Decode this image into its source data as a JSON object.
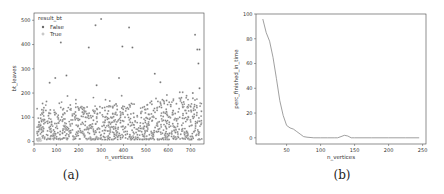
{
  "captions": {
    "a": "(a)",
    "b": "(b)"
  },
  "chart_data": [
    {
      "id": "a",
      "type": "scatter",
      "title": "",
      "xlabel": "n_vertices",
      "ylabel": "bt_leaves",
      "xlim": [
        0,
        760
      ],
      "ylim": [
        -10,
        530
      ],
      "xticks": [
        0,
        100,
        200,
        300,
        400,
        500,
        600,
        700
      ],
      "yticks": [
        0,
        100,
        200,
        300,
        400,
        500
      ],
      "grid": false,
      "legend": {
        "title": "result_bt",
        "position": "upper left",
        "entries": [
          {
            "label": "False",
            "marker": "filled-dot"
          },
          {
            "label": "True",
            "marker": "hollow-dot"
          }
        ]
      },
      "series": [
        {
          "name": "True",
          "points": [
            [
              15,
              5
            ],
            [
              18,
              8
            ],
            [
              20,
              3
            ],
            [
              22,
              10
            ],
            [
              25,
              6
            ],
            [
              28,
              12
            ],
            [
              30,
              4
            ]
          ]
        },
        {
          "name": "False",
          "outliers": [
            [
              120,
              408
            ],
            [
              245,
              388
            ],
            [
              275,
              480
            ],
            [
              300,
              505
            ],
            [
              395,
              392
            ],
            [
              425,
              470
            ],
            [
              440,
              388
            ],
            [
              720,
              440
            ],
            [
              730,
              380
            ],
            [
              740,
              380
            ],
            [
              735,
              322
            ],
            [
              70,
              242
            ],
            [
              95,
              262
            ],
            [
              145,
              272
            ],
            [
              280,
              232
            ],
            [
              380,
              262
            ],
            [
              540,
              280
            ],
            [
              565,
              245
            ],
            [
              710,
              200
            ],
            [
              740,
              220
            ]
          ],
          "density_note": "dense cloud of ~1000 points for n_vertices 10-750 mostly in bt_leaves 10-180, upper envelope rising slightly with n_vertices"
        }
      ]
    },
    {
      "id": "b",
      "type": "line",
      "title": "",
      "xlabel": "n_vertices",
      "ylabel": "perc_finished_in_time",
      "xlim": [
        5,
        255
      ],
      "ylim": [
        -5,
        100
      ],
      "xticks": [
        50,
        100,
        150,
        200,
        250
      ],
      "yticks": [
        0,
        20,
        40,
        60,
        80,
        100
      ],
      "grid": false,
      "series": [
        {
          "name": "perc_finished_in_time",
          "x": [
            15,
            20,
            25,
            30,
            35,
            40,
            45,
            50,
            55,
            60,
            65,
            70,
            75,
            80,
            90,
            100,
            110,
            120,
            125,
            130,
            135,
            140,
            145,
            150,
            175,
            200,
            225,
            245
          ],
          "y": [
            96,
            85,
            78,
            65,
            48,
            30,
            18,
            10,
            8,
            7,
            5,
            3,
            1,
            0.5,
            0,
            0,
            0,
            0,
            0,
            1,
            2,
            1.5,
            0,
            0,
            0,
            0,
            0,
            0
          ]
        }
      ]
    }
  ]
}
